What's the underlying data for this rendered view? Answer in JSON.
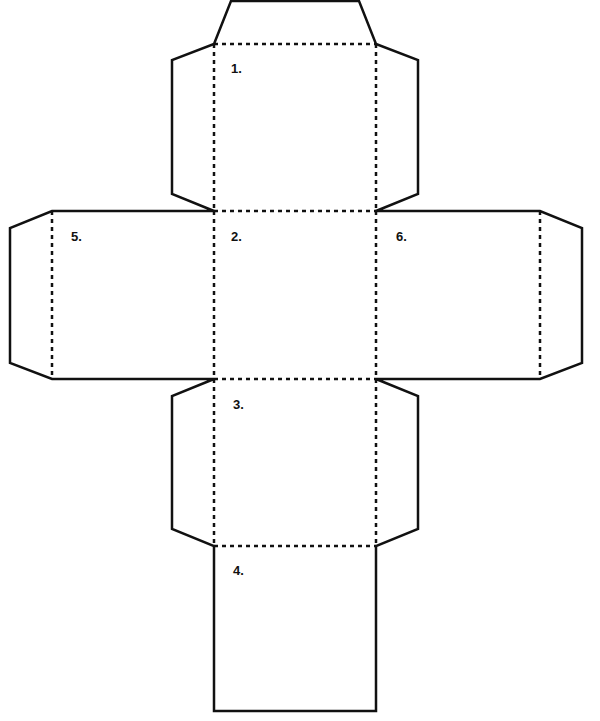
{
  "diagram": {
    "type": "cube-net",
    "legend": {
      "cut_line": "solid",
      "fold_line": "dashed"
    },
    "faces": [
      {
        "id": 1,
        "label": "1."
      },
      {
        "id": 2,
        "label": "2."
      },
      {
        "id": 3,
        "label": "3."
      },
      {
        "id": 4,
        "label": "4."
      },
      {
        "id": 5,
        "label": "5."
      },
      {
        "id": 6,
        "label": "6."
      }
    ],
    "tabs": [
      "face-1-top",
      "face-1-left",
      "face-1-right",
      "face-3-left",
      "face-3-right",
      "face-5-left",
      "face-6-right"
    ],
    "line_color": "#111111",
    "background": "#ffffff"
  }
}
